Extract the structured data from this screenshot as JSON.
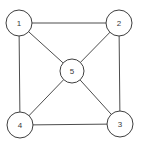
{
  "diagram": {
    "type": "graph",
    "width": 144,
    "height": 146,
    "background_color": "#ffffff",
    "edge_color": "#4d4d4d",
    "edge_width": 1,
    "node_fill_color": "#ffffff",
    "node_stroke_color": "#3f3f3f",
    "label_color": "#3a3a3a",
    "nodes": [
      {
        "id": "1",
        "label": "1",
        "x": 19,
        "y": 23,
        "r": 13
      },
      {
        "id": "2",
        "label": "2",
        "x": 119,
        "y": 23,
        "r": 13
      },
      {
        "id": "3",
        "label": "3",
        "x": 120,
        "y": 124,
        "r": 13
      },
      {
        "id": "4",
        "label": "4",
        "x": 20,
        "y": 125,
        "r": 13
      },
      {
        "id": "5",
        "label": "5",
        "x": 72,
        "y": 71,
        "r": 12
      }
    ],
    "edges": [
      {
        "from": "1",
        "to": "2"
      },
      {
        "from": "2",
        "to": "3"
      },
      {
        "from": "3",
        "to": "4"
      },
      {
        "from": "4",
        "to": "1"
      },
      {
        "from": "1",
        "to": "5"
      },
      {
        "from": "2",
        "to": "5"
      },
      {
        "from": "3",
        "to": "5"
      },
      {
        "from": "4",
        "to": "5"
      }
    ]
  }
}
